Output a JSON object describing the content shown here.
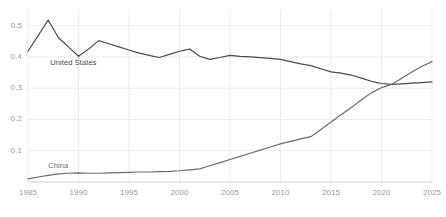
{
  "chart_data": {
    "type": "line",
    "title": "",
    "subtitle": "",
    "xlabel": "",
    "ylabel": "",
    "xlim": [
      1985,
      2025
    ],
    "ylim": [
      0,
      0.55
    ],
    "grid": true,
    "grid_color": "#ebebeb",
    "axis_color": "#cccccc",
    "legend_position": "inline-labels",
    "y_ticks": [
      0.1,
      0.2,
      0.3,
      0.4,
      0.5
    ],
    "y_tick_labels": [
      "0.1",
      "0.2",
      "0.3",
      "0.4",
      "0.5"
    ],
    "x_ticks": [
      1985,
      1990,
      1995,
      2000,
      2005,
      2010,
      2015,
      2020,
      2025
    ],
    "x_tick_labels": [
      "1985",
      "1990",
      "1995",
      "2000",
      "2005",
      "2010",
      "2015",
      "2020",
      "2025"
    ],
    "series": [
      {
        "name": "United States",
        "color": "#4a4a4a",
        "label_x": 1987.2,
        "label_y": 0.382,
        "x": [
          1985,
          1986,
          1987,
          1988,
          1989,
          1990,
          1991,
          1992,
          1993,
          1994,
          1995,
          1996,
          1997,
          1998,
          1999,
          2000,
          2001,
          2002,
          2003,
          2004,
          2005,
          2006,
          2007,
          2008,
          2009,
          2010,
          2011,
          2012,
          2013,
          2014,
          2015,
          2016,
          2017,
          2018,
          2019,
          2020,
          2021,
          2022,
          2023,
          2024,
          2025
        ],
        "values": [
          0.418,
          0.468,
          0.518,
          0.462,
          0.432,
          0.402,
          0.425,
          0.452,
          0.442,
          0.432,
          0.422,
          0.412,
          0.405,
          0.398,
          0.408,
          0.418,
          0.425,
          0.402,
          0.392,
          0.398,
          0.405,
          0.402,
          0.4,
          0.398,
          0.395,
          0.392,
          0.385,
          0.378,
          0.372,
          0.362,
          0.352,
          0.348,
          0.342,
          0.332,
          0.322,
          0.315,
          0.312,
          0.314,
          0.316,
          0.318,
          0.32
        ]
      },
      {
        "name": "China",
        "color": "#6b6b6b",
        "label_x": 1987.0,
        "label_y": 0.052,
        "x": [
          1985,
          1986,
          1987,
          1988,
          1989,
          1990,
          1991,
          1992,
          1993,
          1994,
          1995,
          1996,
          1997,
          1998,
          1999,
          2000,
          2001,
          2002,
          2003,
          2004,
          2005,
          2006,
          2007,
          2008,
          2009,
          2010,
          2011,
          2012,
          2013,
          2014,
          2015,
          2016,
          2017,
          2018,
          2019,
          2020,
          2021,
          2022,
          2023,
          2024,
          2025
        ],
        "values": [
          0.01,
          0.016,
          0.021,
          0.026,
          0.028,
          0.029,
          0.028,
          0.028,
          0.029,
          0.03,
          0.031,
          0.032,
          0.032,
          0.033,
          0.034,
          0.036,
          0.039,
          0.042,
          0.052,
          0.062,
          0.072,
          0.082,
          0.092,
          0.102,
          0.112,
          0.122,
          0.13,
          0.138,
          0.145,
          0.168,
          0.192,
          0.215,
          0.238,
          0.262,
          0.285,
          0.302,
          0.312,
          0.332,
          0.352,
          0.37,
          0.385
        ]
      }
    ]
  }
}
